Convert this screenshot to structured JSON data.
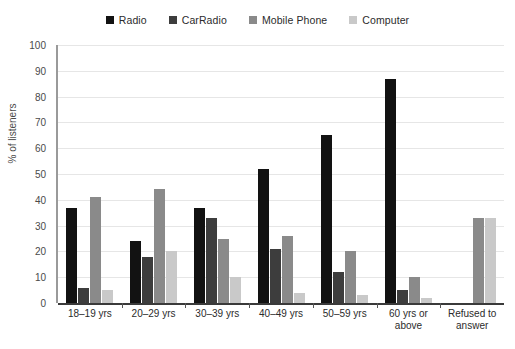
{
  "chart_data": {
    "type": "bar",
    "title": "",
    "subtitle": "",
    "xlabel": "",
    "ylabel": "% of listeners",
    "ylim": [
      0,
      100
    ],
    "ytick_step": 10,
    "yticks": [
      0,
      10,
      20,
      30,
      40,
      50,
      60,
      70,
      80,
      90,
      100
    ],
    "grid": true,
    "legend_position": "top-center",
    "categories": [
      "18–19 yrs",
      "20–29 yrs",
      "30–39 yrs",
      "40–49 yrs",
      "50–59 yrs",
      "60 yrs or\nabove",
      "Refused to\nanswer"
    ],
    "series": [
      {
        "name": "Radio",
        "color": "#121212",
        "values": [
          37,
          24,
          37,
          52,
          65,
          87,
          0
        ]
      },
      {
        "name": "CarRadio",
        "color": "#3d3d3d",
        "values": [
          6,
          18,
          33,
          21,
          12,
          5,
          0
        ]
      },
      {
        "name": "Mobile Phone",
        "color": "#8a8a8a",
        "values": [
          41,
          44,
          25,
          26,
          20,
          10,
          33
        ]
      },
      {
        "name": "Computer",
        "color": "#c9c9c9",
        "values": [
          5,
          20,
          10,
          4,
          3,
          2,
          33
        ]
      }
    ]
  },
  "axis": {
    "y_title": "% of listeners"
  },
  "colors": {
    "radio": "#121212",
    "car_radio": "#3d3d3d",
    "mobile_phone": "#8a8a8a",
    "computer": "#c9c9c9",
    "gridline": "#e6e6e6",
    "axis_line": "#3a3a3a",
    "text": "#2b2b2b"
  }
}
